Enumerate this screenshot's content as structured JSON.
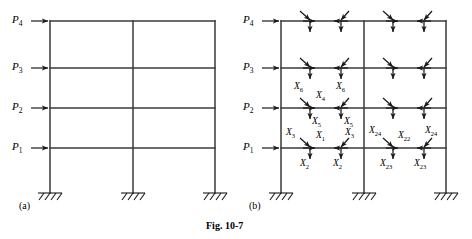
{
  "figure": {
    "caption": "Fig. 10-7",
    "panels": [
      {
        "id": "(a)",
        "description": "two-bay four-story plane frame with lateral loads"
      },
      {
        "id": "(b)",
        "description": "free-body diagram with member-end force redundants"
      }
    ]
  },
  "loads": [
    {
      "name": "P4",
      "label": "P",
      "sub": "4",
      "level": 4
    },
    {
      "name": "P3",
      "label": "P",
      "sub": "3",
      "level": 3
    },
    {
      "name": "P2",
      "label": "P",
      "sub": "2",
      "level": 2
    },
    {
      "name": "P1",
      "label": "P",
      "sub": "1",
      "level": 1
    }
  ],
  "redundants": [
    {
      "name": "X1",
      "label": "X",
      "sub": "1"
    },
    {
      "name": "X2a",
      "label": "X",
      "sub": "2"
    },
    {
      "name": "X2b",
      "label": "X",
      "sub": "2"
    },
    {
      "name": "X3a",
      "label": "X",
      "sub": "3"
    },
    {
      "name": "X3b",
      "label": "X",
      "sub": "3"
    },
    {
      "name": "X4",
      "label": "X",
      "sub": "4"
    },
    {
      "name": "X5a",
      "label": "X",
      "sub": "5"
    },
    {
      "name": "X5b",
      "label": "X",
      "sub": "5"
    },
    {
      "name": "X6a",
      "label": "X",
      "sub": "6"
    },
    {
      "name": "X6b",
      "label": "X",
      "sub": "6"
    },
    {
      "name": "X22",
      "label": "X",
      "sub": "22"
    },
    {
      "name": "X23a",
      "label": "X",
      "sub": "23"
    },
    {
      "name": "X23b",
      "label": "X",
      "sub": "23"
    },
    {
      "name": "X24a",
      "label": "X",
      "sub": "24"
    },
    {
      "name": "X24b",
      "label": "X",
      "sub": "24"
    }
  ],
  "colors": {
    "line": "#1a1a1a",
    "background": "#ffffff"
  },
  "geometry": {
    "stories": 4,
    "bays": 2,
    "support_type": "fixed",
    "support_count": 3
  }
}
